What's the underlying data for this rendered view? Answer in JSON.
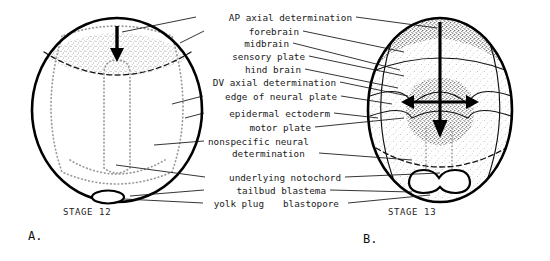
{
  "figure": {
    "type": "biological-diagram",
    "background_color": "#ffffff",
    "ink_color": "#000000"
  },
  "labels": [
    {
      "id": "ap-axial-determination",
      "text": "AP axial determination"
    },
    {
      "id": "forebrain",
      "text": "forebrain"
    },
    {
      "id": "midbrain",
      "text": "midbrain"
    },
    {
      "id": "sensory-plate",
      "text": "sensory plate"
    },
    {
      "id": "hind-brain",
      "text": "hind brain"
    },
    {
      "id": "dv-axial-determination",
      "text": "DV axial determination"
    },
    {
      "id": "edge-of-neural-plate",
      "text": "edge of neural plate"
    },
    {
      "id": "epidermal-ectoderm",
      "text": "epidermal ectoderm"
    },
    {
      "id": "motor-plate",
      "text": "motor plate"
    },
    {
      "id": "nonspecific-neural",
      "text": "nonspecific neural"
    },
    {
      "id": "determination",
      "text": "determination"
    },
    {
      "id": "underlying-notochord",
      "text": "underlying notochord"
    },
    {
      "id": "tailbud-blastema",
      "text": "tailbud blastema"
    },
    {
      "id": "yolk-plug",
      "text": "yolk plug"
    },
    {
      "id": "blastopore",
      "text": "blastopore"
    }
  ],
  "panels": {
    "left": {
      "letter": "A.",
      "stage": "STAGE 12"
    },
    "right": {
      "letter": "B.",
      "stage": "STAGE 13"
    }
  }
}
